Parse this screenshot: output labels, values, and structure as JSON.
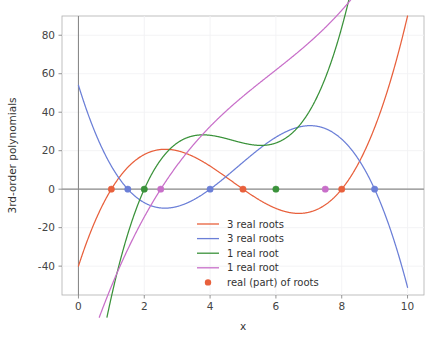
{
  "chart_data": {
    "type": "line",
    "title": "",
    "xlabel": "x",
    "ylabel": "3rd-order polynomials",
    "xlim": [
      -0.5,
      10.5
    ],
    "ylim": [
      -55,
      90
    ],
    "grid": true,
    "grid_color": "#f2f2f4",
    "background": "#ffffff",
    "legend_position": "lower center",
    "xticks": [
      "0",
      "2",
      "4",
      "6",
      "8",
      "10"
    ],
    "xtick_values": [
      0,
      2,
      4,
      6,
      8,
      10
    ],
    "yticks": [
      "80",
      "60",
      "40",
      "20",
      "0",
      "-20",
      "-40"
    ],
    "ytick_values": [
      80,
      60,
      40,
      20,
      0,
      -20,
      -40
    ],
    "zero_line": 0,
    "series": [
      {
        "name": "3 real roots",
        "color": "#e8603c",
        "roots_real": [
          1,
          5,
          8
        ],
        "marker_x": [
          1,
          5,
          8
        ],
        "key_points": {
          "y_at_0": -40,
          "local_max": {
            "x": 2.6,
            "y": 20.5
          },
          "local_min": {
            "x": 6.7,
            "y": -13.0
          },
          "y_at_10": 90
        }
      },
      {
        "name": "3 real roots",
        "color": "#6b7fd7",
        "roots_real": [
          1.5,
          4,
          9
        ],
        "marker_x": [
          1.5,
          4,
          9
        ],
        "key_points": {
          "y_at_0": 54,
          "local_min": {
            "x": 2.6,
            "y": -10.3
          },
          "local_max": {
            "x": 7.0,
            "y": 33.5
          },
          "y_at_10": -44
        }
      },
      {
        "name": "1 real root",
        "color": "#3a923a",
        "roots_real": [
          2
        ],
        "marker_x": [
          2,
          6
        ],
        "key_points": {
          "y_at_0": -40,
          "plateau": {
            "x": 4.5,
            "y": 8.0
          },
          "y_at_10": 76
        }
      },
      {
        "name": "1 real root",
        "color": "#c86fc9",
        "roots_real": [
          2.5
        ],
        "marker_x": [
          2.5,
          7.5
        ],
        "key_points": {
          "y_at_0": -50,
          "y_at_10": 57
        }
      },
      {
        "name": "real (part) of roots",
        "color": "#e8603c",
        "marker_only": true
      }
    ],
    "root_markers": [
      {
        "x": 1,
        "color": "#e8603c"
      },
      {
        "x": 1.5,
        "color": "#6b7fd7"
      },
      {
        "x": 2,
        "color": "#3a923a"
      },
      {
        "x": 2.5,
        "color": "#c86fc9"
      },
      {
        "x": 4,
        "color": "#6b7fd7"
      },
      {
        "x": 5,
        "color": "#e8603c"
      },
      {
        "x": 6,
        "color": "#3a923a"
      },
      {
        "x": 7.5,
        "color": "#c86fc9"
      },
      {
        "x": 8,
        "color": "#e8603c"
      },
      {
        "x": 9,
        "color": "#6b7fd7"
      }
    ]
  },
  "axes": {
    "ylabel": "3rd-order polynomials",
    "xlabel": "x",
    "xtick_labels": [
      "0",
      "2",
      "4",
      "6",
      "8",
      "10"
    ],
    "ytick_labels": [
      "80",
      "60",
      "40",
      "20",
      "0",
      "-20",
      "-40"
    ]
  },
  "legend": {
    "entries": [
      {
        "label": "3 real roots",
        "color": "#e8603c",
        "kind": "line"
      },
      {
        "label": "3 real roots",
        "color": "#6b7fd7",
        "kind": "line"
      },
      {
        "label": "1 real root",
        "color": "#3a923a",
        "kind": "line"
      },
      {
        "label": "1 real root",
        "color": "#c86fc9",
        "kind": "line"
      },
      {
        "label": "real (part) of roots",
        "color": "#e8603c",
        "kind": "marker"
      }
    ]
  }
}
